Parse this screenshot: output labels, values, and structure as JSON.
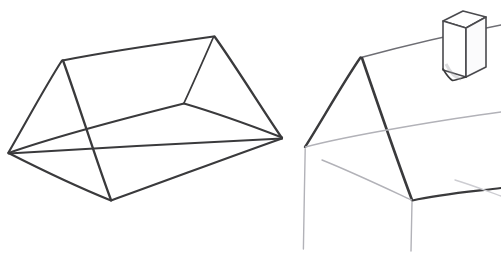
{
  "image": {
    "title": "Pencil sketch - two stages of drawing a gable roof house",
    "background_color": "#ffffff",
    "width": 501,
    "height": 261,
    "medium": "graphite pencil line drawing",
    "ink_colors": {
      "dark": "#3a3a3c",
      "mid": "#6e6e74",
      "light": "#b2b2b8",
      "faint": "#cdcdd2"
    }
  },
  "figures": [
    {
      "id": "left-figure",
      "name": "triangular-prism-wireframe",
      "description": "Wireframe triangular prism seen in three-quarter view, like a tent or simple gable roof volume, all hidden edges drawn.",
      "vertices": {
        "near_left_apex": [
          62,
          60
        ],
        "far_right_apex": [
          214,
          36
        ],
        "near_left_base": [
          8,
          153
        ],
        "front_base": [
          111,
          200
        ],
        "right_base": [
          282,
          138
        ],
        "back_base": [
          184,
          103
        ]
      },
      "edges": [
        {
          "name": "ridge",
          "from": "near_left_apex",
          "to": "far_right_apex"
        },
        {
          "name": "left-gable-left-slope",
          "from": "near_left_apex",
          "to": "near_left_base"
        },
        {
          "name": "left-gable-right-slope",
          "from": "near_left_apex",
          "to": "front_base"
        },
        {
          "name": "left-gable-base",
          "from": "near_left_base",
          "to": "front_base"
        },
        {
          "name": "right-gable-left-slope",
          "from": "far_right_apex",
          "to": "back_base"
        },
        {
          "name": "right-gable-right-slope",
          "from": "far_right_apex",
          "to": "right_base"
        },
        {
          "name": "right-gable-base",
          "from": "back_base",
          "to": "right_base"
        },
        {
          "name": "front-lower-long-edge",
          "from": "front_base",
          "to": "right_base"
        },
        {
          "name": "back-lower-long-edge",
          "from": "near_left_base",
          "to": "back_base"
        },
        {
          "name": "floor-diagonal",
          "from": "near_left_base",
          "to": "right_base"
        }
      ]
    },
    {
      "id": "right-figure",
      "name": "house-roof-with-chimney",
      "description": "Same volume developed into a house: dark gable roof, light construction lines for walls and eaves, vertical corner guide lines, and a box chimney blocked in on the rear roof slope.",
      "vertices": {
        "roof_peak": [
          361,
          57
        ],
        "left_eave": [
          305,
          147
        ],
        "front_eave": [
          412,
          200
        ],
        "ridge_far_end": [
          501,
          25
        ],
        "back_eave_far": [
          501,
          112
        ],
        "right_lower_far": [
          501,
          188
        ]
      },
      "edges": [
        {
          "name": "ridge",
          "from": "roof_peak",
          "to": "ridge_far_end",
          "weight": "mid"
        },
        {
          "name": "front-roof-slope",
          "from": "roof_peak",
          "to": "front_eave",
          "weight": "dark"
        },
        {
          "name": "back-roof-slope",
          "from": "roof_peak",
          "to": "left_eave",
          "weight": "dark"
        },
        {
          "name": "front-eave-line",
          "from": "front_eave",
          "to": "right_lower_far",
          "weight": "dark"
        },
        {
          "name": "back-eave-line",
          "from": "left_eave",
          "to": "back_eave_far",
          "weight": "light"
        },
        {
          "name": "wall-top-construction-line",
          "from": [
            322,
            160
          ],
          "to": [
            412,
            200
          ],
          "weight": "light"
        },
        {
          "name": "left-wall-corner-vertical",
          "from": [
            305,
            148
          ],
          "to": [
            303,
            249
          ],
          "weight": "light"
        },
        {
          "name": "front-wall-corner-vertical",
          "from": [
            412,
            202
          ],
          "to": [
            411,
            251
          ],
          "weight": "light"
        },
        {
          "name": "far-lower-construction-line",
          "from": [
            455,
            180
          ],
          "to": [
            501,
            196
          ],
          "weight": "faint"
        }
      ],
      "chimney": {
        "name": "chimney-box",
        "description": "Upright rectangular box sitting on the rear roof slope, drawn with visible top face and a soft shadow side.",
        "top_face": [
          [
            443,
            21
          ],
          [
            463,
            11
          ],
          [
            486,
            17
          ],
          [
            466,
            28
          ]
        ],
        "front_left_face": [
          [
            443,
            21
          ],
          [
            466,
            28
          ],
          [
            466,
            77
          ],
          [
            443,
            70
          ]
        ],
        "right_face": [
          [
            466,
            28
          ],
          [
            486,
            17
          ],
          [
            486,
            67
          ],
          [
            466,
            77
          ]
        ],
        "bottom_notch": [
          [
            443,
            70
          ],
          [
            452,
            80
          ],
          [
            466,
            77
          ]
        ],
        "height_px": 60
      }
    }
  ],
  "annotations": {
    "caption": "",
    "labels": []
  }
}
